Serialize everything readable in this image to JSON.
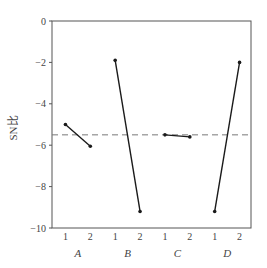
{
  "chart_data": {
    "type": "line",
    "title": "",
    "xlabel": "",
    "ylabel": "SN比",
    "ylim": [
      -10,
      0
    ],
    "yticks": [
      0,
      -2,
      -4,
      -6,
      -8,
      -10
    ],
    "ytick_labels": [
      "0",
      "−2",
      "−4",
      "−6",
      "−8",
      "−10"
    ],
    "grid": false,
    "legend": null,
    "factors": [
      "A",
      "B",
      "C",
      "D"
    ],
    "levels": [
      "1",
      "2"
    ],
    "series": [
      {
        "name": "A",
        "values": [
          -5.0,
          -6.05
        ]
      },
      {
        "name": "B",
        "values": [
          -1.9,
          -9.2
        ]
      },
      {
        "name": "C",
        "values": [
          -5.5,
          -5.6
        ]
      },
      {
        "name": "D",
        "values": [
          -9.2,
          -2.0
        ]
      }
    ],
    "reference_line": {
      "label": "mean",
      "value": -5.5,
      "style": "dashed"
    },
    "colors": {
      "line": "#1a1a1a",
      "axis": "#555555",
      "reference": "#777777"
    }
  }
}
